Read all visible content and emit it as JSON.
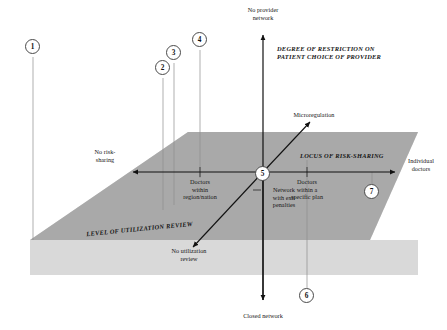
{
  "figure": {
    "type": "three-axis conceptual diagram with shaded plane",
    "colors": {
      "plane_dark": "#a9a9a9",
      "plane_light": "#d8d8d8",
      "axis_line": "#111111",
      "drop_line": "#8a8a8a",
      "circle_stroke": "#4a4a4a",
      "background": "#ffffff"
    }
  },
  "axes": {
    "vertical": {
      "title": "DEGREE OF RESTRICTION ON\nPATIENT CHOICE OF PROVIDER",
      "top_label": "No provider\nnetwork",
      "bottom_label": "Closed network"
    },
    "horizontal": {
      "title": "LOCUS OF RISK-SHARING",
      "left_label": "No risk-\nsharing",
      "right_label": "Individual\ndoctors",
      "tick_labels": [
        "Doctors\nwithin\nregion/nation",
        "Network\nwith exit\npenalties",
        "Doctors\nwithin a\nspecific plan"
      ]
    },
    "diagonal": {
      "title": "LEVEL OF UTILIZATION REVIEW",
      "far_label": "Microregulation",
      "near_label": "No utilization\nreview"
    }
  },
  "callouts": [
    {
      "id": "1",
      "label": "1"
    },
    {
      "id": "2",
      "label": "2"
    },
    {
      "id": "3",
      "label": "3"
    },
    {
      "id": "4",
      "label": "4"
    },
    {
      "id": "5",
      "label": "5"
    },
    {
      "id": "6",
      "label": "6"
    },
    {
      "id": "7",
      "label": "7"
    }
  ]
}
